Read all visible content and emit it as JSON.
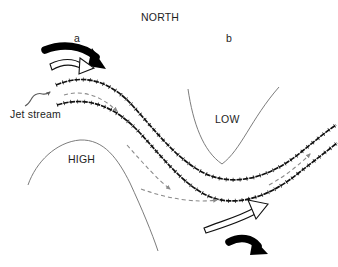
{
  "figure": {
    "type": "meteorological-diagram",
    "background_color": "#ffffff",
    "ink_color": "#111111",
    "contour_color": "#6d6d6d",
    "dashed_color": "#8a8a8a"
  },
  "labels": {
    "north": "NORTH",
    "point_a": "a",
    "point_b": "b",
    "jet_stream": "Jet stream",
    "low": "LOW",
    "high": "HIGH"
  },
  "elements": {
    "jet_stream_band": {
      "name": "jet-stream-band",
      "description": "Two parallel wavy barbed lines forming a ridge-trough wave running from upper-left to right",
      "upper_boundary_path": "M 56 84 C 84 72, 110 80, 132 104 C 154 128, 176 158, 204 172 C 232 186, 268 178, 300 152 C 316 139, 326 130, 334 124",
      "lower_boundary_path": "M 57 104 C 88 94, 116 106, 140 132 C 162 156, 182 182, 206 194 C 232 207, 266 198, 296 174 C 314 160, 326 150, 337 142"
    },
    "dashed_flow_arrows": [
      {
        "name": "dashed-arrow-1",
        "path": "M 66 96 C 86 90, 104 98, 118 112",
        "direction": "downstream"
      },
      {
        "name": "dashed-arrow-2",
        "path": "M 128 146 C 144 164, 158 180, 172 190",
        "direction": "downstream"
      },
      {
        "name": "dashed-arrow-3",
        "path": "M 140 188 C 168 198, 196 202, 218 200",
        "direction": "downstream"
      },
      {
        "name": "dashed-arrow-4",
        "path": "M 268 184 C 286 174, 300 164, 310 154",
        "direction": "downstream"
      }
    ],
    "contours": [
      {
        "name": "high-ridge-contour",
        "label": "HIGH",
        "path": "M 28 185 C 38 160, 58 142, 80 140 C 104 138, 118 158, 130 182 C 142 208, 152 232, 158 249"
      },
      {
        "name": "low-trough-contour",
        "label": "LOW",
        "path": "M 188 90 C 194 122, 204 150, 222 163 C 240 150, 250 120, 278 88"
      }
    ],
    "arrow_pairs": [
      {
        "name": "divergence-arrow-pair-a",
        "location": "top-left above ridge",
        "solid_black_arrow": "curved thick black arrow pointing right-down",
        "hollow_outline_arrow": "curved white-filled outlined arrow pointing right"
      },
      {
        "name": "convergence-arrow-pair-b",
        "location": "bottom-right below trough",
        "solid_black_arrow": "curved thick black arrow pointing right-down",
        "hollow_outline_arrow": "curved white-filled outlined arrow pointing right-up"
      }
    ],
    "jet_stream_pointer": {
      "name": "jet-stream-pointer-arrow",
      "description": "Small squiggly arrow from the Jet stream label up toward the band",
      "path": "M 28 103 C 34 99, 32 93, 38 91 C 44 89, 44 94, 50 90"
    }
  }
}
